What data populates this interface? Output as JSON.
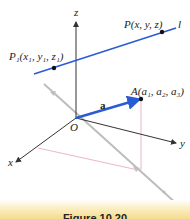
{
  "figure": {
    "labels": {
      "z_axis": "z",
      "x_axis": "x",
      "y_axis": "y",
      "origin": "O",
      "line": "l",
      "point_p": "P(x, y, z)",
      "point_p1": "P₁(x₁, y₁, z₁)",
      "point_a": "A(a₁, a₂, a₃)",
      "vector_a": "a"
    },
    "caption": "Figure 10.20",
    "colors": {
      "line": "#2a5bd7",
      "vector": "#2a5bd7",
      "axes": "#333333",
      "gray_line": "#b8b8b8",
      "projection": "#e8a8b8",
      "caption_bg": "#f4dc8e"
    }
  }
}
